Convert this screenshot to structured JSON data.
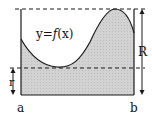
{
  "diagram": {
    "curve_label": "y=f(x)",
    "curve_label_parts": {
      "prefix": "y=",
      "func": "f",
      "arg": "(x)"
    },
    "labels": {
      "left_bound": "a",
      "right_bound": "b",
      "outer_radius": "R",
      "inner_radius": "r"
    },
    "colors": {
      "fill": "#cfcfcf",
      "stroke": "#1a1a1a",
      "background": "#ffffff"
    }
  }
}
